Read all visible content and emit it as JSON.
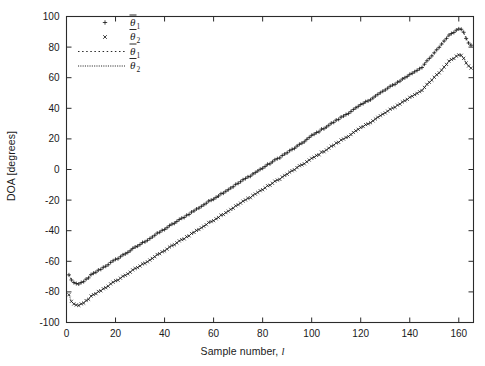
{
  "figure": {
    "background": "#ffffff",
    "frame_color": "#2b2b2b",
    "trace_color": "#111111"
  },
  "axes": {
    "x_label": "Sample number, ",
    "x_label_italic": "l",
    "y_label": "DOA [degrees]",
    "x_ticks": [
      "0",
      "20",
      "40",
      "60",
      "80",
      "100",
      "120",
      "140",
      "160"
    ],
    "y_ticks": [
      "100",
      "80",
      "60",
      "40",
      "20",
      "0",
      "-20",
      "-40",
      "-60",
      "-80",
      "-100"
    ]
  },
  "legend": {
    "items": [
      {
        "symbol": "plus-marker-icon",
        "glyph": "+",
        "kind": "marker",
        "base": "θ",
        "sub": "1"
      },
      {
        "symbol": "cross-marker-icon",
        "glyph": "×",
        "kind": "marker",
        "base": "θ",
        "sub": "2"
      },
      {
        "symbol": "dotted-line-icon",
        "glyph": "",
        "kind": "line-dotted",
        "base": "θ",
        "sub": "1"
      },
      {
        "symbol": "dense-dotted-line-icon",
        "glyph": "",
        "kind": "line-dense-dotted",
        "base": "θ",
        "sub": "2"
      }
    ]
  },
  "chart_data": {
    "type": "scatter",
    "title": "",
    "xlabel": "Sample number, l",
    "ylabel": "DOA [degrees]",
    "xlim": [
      0,
      166
    ],
    "ylim": [
      -100,
      100
    ],
    "xticks": [
      0,
      20,
      40,
      60,
      80,
      100,
      120,
      140,
      160
    ],
    "yticks": [
      -100,
      -80,
      -60,
      -40,
      -20,
      0,
      20,
      40,
      60,
      80,
      100
    ],
    "grid": false,
    "legend_position": "upper-left-inside",
    "series": [
      {
        "name": "theta_bar_1_estimate",
        "marker": "+",
        "linestyle": "dotted",
        "x": [
          1,
          2,
          3,
          4,
          5,
          6,
          7,
          8,
          9,
          10,
          12,
          14,
          16,
          18,
          20,
          25,
          30,
          35,
          40,
          45,
          50,
          55,
          60,
          65,
          70,
          75,
          80,
          85,
          90,
          95,
          100,
          105,
          110,
          115,
          120,
          125,
          130,
          135,
          140,
          145,
          150,
          153,
          155,
          157,
          159,
          160,
          161,
          162,
          163,
          164,
          165
        ],
        "y": [
          -69,
          -72,
          -74,
          -75,
          -75,
          -74,
          -73,
          -72,
          -71,
          -69,
          -67,
          -65,
          -63,
          -61,
          -59,
          -54,
          -49,
          -44,
          -39,
          -34,
          -29,
          -24,
          -19,
          -14,
          -9,
          -4,
          1,
          6,
          11,
          16,
          22,
          27,
          32,
          37,
          42,
          47,
          52,
          57,
          62,
          67,
          76,
          82,
          86,
          89,
          91,
          92,
          92,
          90,
          86,
          83,
          81
        ]
      },
      {
        "name": "theta_bar_2_estimate",
        "marker": "x",
        "linestyle": "dense-dotted",
        "x": [
          1,
          2,
          3,
          4,
          5,
          6,
          7,
          8,
          9,
          10,
          12,
          14,
          16,
          18,
          20,
          25,
          30,
          35,
          40,
          45,
          50,
          55,
          60,
          65,
          70,
          75,
          80,
          85,
          90,
          95,
          100,
          105,
          110,
          115,
          120,
          125,
          130,
          135,
          140,
          145,
          150,
          153,
          155,
          157,
          159,
          160,
          161,
          162,
          163,
          164,
          165
        ],
        "y": [
          -82,
          -86,
          -88,
          -89,
          -89,
          -88,
          -87,
          -86,
          -85,
          -83,
          -81,
          -79,
          -77,
          -75,
          -73,
          -68,
          -63,
          -58,
          -53,
          -48,
          -43,
          -38,
          -33,
          -28,
          -23,
          -18,
          -13,
          -8,
          -3,
          2,
          7,
          12,
          17,
          22,
          27,
          32,
          37,
          42,
          47,
          52,
          60,
          65,
          69,
          72,
          74,
          75,
          75,
          73,
          70,
          68,
          66
        ]
      }
    ]
  }
}
